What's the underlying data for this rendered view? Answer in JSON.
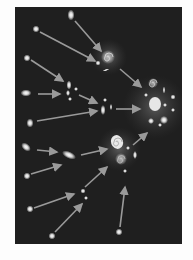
{
  "figure": {
    "background_color": "#1f1f1f",
    "glow_color": "#ffffff",
    "arrow_color": "#9a9a9a"
  },
  "galaxies": [
    {
      "id": "g1",
      "x": 56,
      "y": 8,
      "rx": 2,
      "ry": 4
    },
    {
      "id": "g2",
      "x": 21,
      "y": 22,
      "rx": 2,
      "ry": 2
    },
    {
      "id": "g3",
      "x": 12,
      "y": 51,
      "rx": 2,
      "ry": 2
    },
    {
      "id": "g4",
      "x": 11,
      "y": 86,
      "rx": 4,
      "ry": 2
    },
    {
      "id": "g5",
      "x": 15,
      "y": 116,
      "rx": 2,
      "ry": 3
    },
    {
      "id": "g6",
      "x": 11,
      "y": 140,
      "rx": 4,
      "ry": 2,
      "rot": 40
    },
    {
      "id": "g7",
      "x": 12,
      "y": 169,
      "rx": 2,
      "ry": 2
    },
    {
      "id": "g8",
      "x": 15,
      "y": 202,
      "rx": 2,
      "ry": 2
    },
    {
      "id": "g9",
      "x": 37,
      "y": 229,
      "rx": 2,
      "ry": 2
    },
    {
      "id": "g10",
      "x": 104,
      "y": 225,
      "rx": 2,
      "ry": 2
    },
    {
      "id": "g11",
      "x": 54,
      "y": 148,
      "rx": 6,
      "ry": 2,
      "rot": 25
    }
  ],
  "groups": [
    {
      "id": "pair-a",
      "x": 54,
      "y": 83
    },
    {
      "id": "pair-b",
      "x": 88,
      "y": 101
    },
    {
      "id": "spiral-a",
      "x": 92,
      "y": 50
    },
    {
      "id": "spiral-b",
      "x": 102,
      "y": 145
    },
    {
      "id": "cluster-a",
      "x": 138,
      "y": 103
    },
    {
      "id": "trio",
      "x": 70,
      "y": 187
    }
  ],
  "arrows": [
    {
      "x1": 60,
      "y1": 14,
      "x2": 86,
      "y2": 44
    },
    {
      "x1": 25,
      "y1": 25,
      "x2": 80,
      "y2": 54
    },
    {
      "x1": 16,
      "y1": 53,
      "x2": 48,
      "y2": 74
    },
    {
      "x1": 23,
      "y1": 87,
      "x2": 45,
      "y2": 87
    },
    {
      "x1": 64,
      "y1": 88,
      "x2": 82,
      "y2": 96
    },
    {
      "x1": 22,
      "y1": 114,
      "x2": 82,
      "y2": 104
    },
    {
      "x1": 105,
      "y1": 62,
      "x2": 126,
      "y2": 80
    },
    {
      "x1": 101,
      "y1": 102,
      "x2": 125,
      "y2": 102
    },
    {
      "x1": 22,
      "y1": 143,
      "x2": 42,
      "y2": 145
    },
    {
      "x1": 66,
      "y1": 148,
      "x2": 92,
      "y2": 142
    },
    {
      "x1": 16,
      "y1": 167,
      "x2": 46,
      "y2": 158
    },
    {
      "x1": 118,
      "y1": 138,
      "x2": 132,
      "y2": 126
    },
    {
      "x1": 70,
      "y1": 180,
      "x2": 92,
      "y2": 160
    },
    {
      "x1": 19,
      "y1": 201,
      "x2": 59,
      "y2": 187
    },
    {
      "x1": 40,
      "y1": 225,
      "x2": 67,
      "y2": 197
    },
    {
      "x1": 105,
      "y1": 220,
      "x2": 110,
      "y2": 180
    }
  ]
}
